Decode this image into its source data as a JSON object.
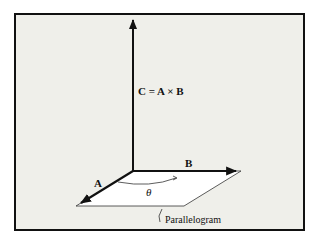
{
  "diagram": {
    "equation_label": "C = A × B",
    "vector_a_label": "A",
    "vector_b_label": "B",
    "angle_label": "θ",
    "parallelogram_label": "Parallelogram",
    "colors": {
      "background": "#efefea",
      "frame": "#111111",
      "vector": "#111111",
      "parallelogram_fill": "#ffffff"
    }
  }
}
